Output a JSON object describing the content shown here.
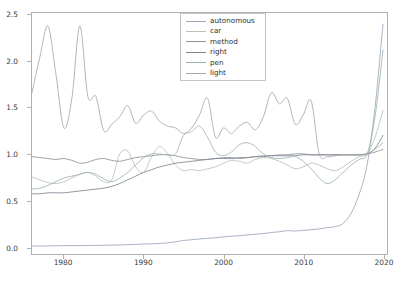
{
  "chart_data": {
    "type": "line",
    "title": "",
    "xlabel": "",
    "ylabel": "",
    "xlim": [
      1976,
      2020.5
    ],
    "ylim": [
      -0.08,
      2.52
    ],
    "xticks": [
      1980,
      1990,
      2000,
      2010,
      2020
    ],
    "xtick_labels": [
      "1980",
      "1990",
      "2000",
      "2010",
      "2020"
    ],
    "yticks": [
      0.0,
      0.5,
      1.0,
      1.5,
      2.0,
      2.5
    ],
    "ytick_labels": [
      "0.0",
      "0.5",
      "1.0",
      "1.5",
      "2.0",
      "2.5"
    ],
    "grid": false,
    "legend_position": "upper center",
    "legend_labels": [
      "autonomous",
      "car",
      "method",
      "right",
      "pen",
      "light"
    ],
    "colors": [
      "#9aa7b8",
      "#b9c3b0",
      "#8f9298",
      "#7d8591",
      "#9fb3ae",
      "#a2a8ad"
    ],
    "x": [
      1976,
      1977,
      1978,
      1979,
      1980,
      1981,
      1982,
      1983,
      1984,
      1985,
      1986,
      1987,
      1988,
      1989,
      1990,
      1991,
      1992,
      1993,
      1994,
      1995,
      1996,
      1997,
      1998,
      1999,
      2000,
      2001,
      2002,
      2003,
      2004,
      2005,
      2006,
      2007,
      2008,
      2009,
      2010,
      2011,
      2012,
      2013,
      2014,
      2015,
      2016,
      2017,
      2018,
      2019,
      2020
    ],
    "series": [
      {
        "name": "autonomous",
        "color": "#9aa7b8",
        "values": [
          0.005,
          0.006,
          0.007,
          0.008,
          0.01,
          0.011,
          0.01,
          0.012,
          0.013,
          0.014,
          0.016,
          0.018,
          0.021,
          0.024,
          0.028,
          0.03,
          0.034,
          0.04,
          0.052,
          0.066,
          0.074,
          0.082,
          0.09,
          0.095,
          0.105,
          0.112,
          0.118,
          0.126,
          0.133,
          0.14,
          0.152,
          0.16,
          0.172,
          0.168,
          0.176,
          0.182,
          0.19,
          0.205,
          0.215,
          0.25,
          0.36,
          0.56,
          0.88,
          1.5,
          2.4
        ]
      },
      {
        "name": "car",
        "color": "#b9c3b0",
        "values": [
          0.75,
          0.72,
          0.69,
          0.68,
          0.7,
          0.74,
          0.78,
          0.8,
          0.76,
          0.7,
          0.72,
          1.0,
          1.03,
          0.86,
          0.8,
          0.97,
          1.08,
          1.0,
          0.88,
          0.82,
          0.83,
          0.82,
          0.84,
          0.86,
          0.9,
          0.93,
          0.92,
          0.9,
          0.94,
          0.96,
          0.95,
          0.92,
          0.88,
          0.84,
          0.86,
          0.9,
          0.88,
          0.84,
          0.82,
          0.86,
          0.92,
          0.97,
          1.0,
          1.18,
          1.47
        ]
      },
      {
        "name": "method",
        "color": "#8f9298",
        "values": [
          0.97,
          0.96,
          0.95,
          0.94,
          0.95,
          0.93,
          0.9,
          0.91,
          0.94,
          0.95,
          0.93,
          0.92,
          0.94,
          0.96,
          0.97,
          0.98,
          0.99,
          0.99,
          0.98,
          0.96,
          0.95,
          0.94,
          0.94,
          0.95,
          0.96,
          0.96,
          0.95,
          0.96,
          0.97,
          0.98,
          0.98,
          0.99,
          0.99,
          1.0,
          1.0,
          0.99,
          0.99,
          0.99,
          0.99,
          0.99,
          0.99,
          0.99,
          1.0,
          1.02,
          1.05
        ]
      },
      {
        "name": "right",
        "color": "#7d8591",
        "values": [
          0.57,
          0.57,
          0.58,
          0.58,
          0.58,
          0.59,
          0.6,
          0.61,
          0.62,
          0.63,
          0.65,
          0.68,
          0.72,
          0.76,
          0.8,
          0.83,
          0.86,
          0.88,
          0.9,
          0.91,
          0.92,
          0.93,
          0.94,
          0.95,
          0.95,
          0.95,
          0.96,
          0.96,
          0.97,
          0.97,
          0.98,
          0.98,
          0.98,
          0.98,
          0.99,
          0.99,
          0.99,
          0.99,
          0.99,
          0.99,
          0.99,
          0.99,
          1.0,
          1.06,
          1.2
        ]
      },
      {
        "name": "pen",
        "color": "#9fb3ae",
        "values": [
          0.62,
          0.63,
          0.66,
          0.7,
          0.74,
          0.76,
          0.78,
          0.8,
          0.78,
          0.73,
          0.7,
          0.74,
          0.8,
          0.88,
          0.96,
          1.0,
          1.0,
          0.99,
          1.0,
          1.2,
          1.24,
          1.3,
          1.18,
          1.02,
          0.98,
          1.02,
          1.1,
          1.12,
          1.08,
          1.0,
          0.96,
          0.95,
          0.96,
          0.97,
          0.92,
          0.84,
          0.74,
          0.68,
          0.72,
          0.8,
          0.88,
          0.94,
          1.0,
          1.4,
          2.12
        ]
      },
      {
        "name": "light",
        "color": "#a2a8ad",
        "values": [
          1.66,
          2.05,
          2.38,
          1.86,
          1.28,
          1.6,
          2.38,
          1.62,
          1.62,
          1.25,
          1.32,
          1.4,
          1.52,
          1.33,
          1.42,
          1.46,
          1.35,
          1.3,
          1.28,
          1.22,
          1.28,
          1.42,
          1.6,
          1.18,
          1.28,
          1.22,
          1.3,
          1.34,
          1.26,
          1.4,
          1.66,
          1.54,
          1.6,
          1.32,
          1.42,
          1.57,
          1.0,
          0.97,
          0.98,
          0.99,
          0.99,
          0.99,
          1.0,
          1.05,
          1.12
        ]
      }
    ]
  }
}
